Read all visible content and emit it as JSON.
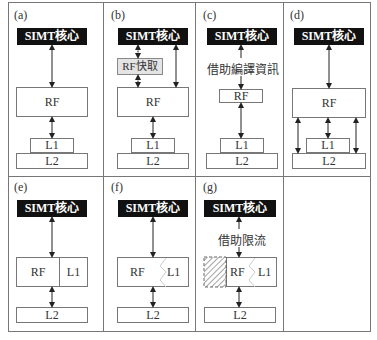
{
  "panels": {
    "a": {
      "label": "(a)",
      "core": "SIMT核心",
      "rf": "RF",
      "l1": "L1",
      "l2": "L2"
    },
    "b": {
      "label": "(b)",
      "core": "SIMT核心",
      "rf_cache": "RF快取",
      "rf": "RF",
      "l1": "L1",
      "l2": "L2"
    },
    "c": {
      "label": "(c)",
      "core": "SIMT核心",
      "note": "借助編譯資訊",
      "rf": "RF",
      "l1": "L1",
      "l2": "L2"
    },
    "d": {
      "label": "(d)",
      "core": "SIMT核心",
      "rf": "RF",
      "l1": "L1",
      "l2": "L2"
    },
    "e": {
      "label": "(e)",
      "core": "SIMT核心",
      "rf": "RF",
      "l1": "L1",
      "l2": "L2"
    },
    "f": {
      "label": "(f)",
      "core": "SIMT核心",
      "rf": "RF",
      "l1": "L1",
      "l2": "L2"
    },
    "g": {
      "label": "(g)",
      "core": "SIMT核心",
      "note": "借助限流",
      "rf": "RF",
      "l1": "L1",
      "l2": "L2"
    }
  },
  "colors": {
    "core_bg": "#111111",
    "border": "#777777",
    "rf_cache_bg": "#e4e4e4"
  }
}
